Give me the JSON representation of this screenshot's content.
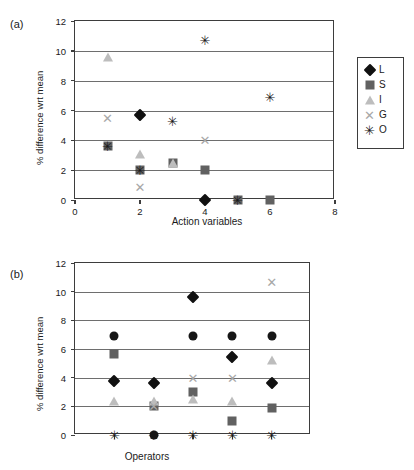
{
  "figure": {
    "background": "#ffffff",
    "panels": [
      {
        "label": "(a)",
        "xlabel": "Action variables",
        "ylabel": "% difference wrt mean"
      },
      {
        "label": "(b)",
        "xlabel": "Operators",
        "ylabel": "% difference wrt mean"
      }
    ]
  },
  "chart_data": [
    {
      "type": "scatter",
      "title": "(a)",
      "xlabel": "Action variables",
      "ylabel": "% difference wrt mean",
      "xlim": [
        0,
        8
      ],
      "ylim": [
        0,
        12
      ],
      "xticks": [
        0,
        2,
        4,
        6,
        8
      ],
      "xtick_labels": [
        "0",
        "2",
        "4",
        "6",
        "8"
      ],
      "yticks": [
        0,
        2,
        4,
        6,
        8,
        10,
        12
      ],
      "ytick_labels": [
        "0",
        "2",
        "4",
        "6",
        "8",
        "10",
        "12"
      ],
      "grid": "horizontal",
      "legend_position": "right",
      "series": [
        {
          "name": "L",
          "marker": "diamond",
          "color": "#111111",
          "points": [
            {
              "x": 2,
              "y": 5.7
            },
            {
              "x": 4,
              "y": 0.0
            }
          ]
        },
        {
          "name": "S",
          "marker": "square",
          "color": "#616161",
          "points": [
            {
              "x": 1,
              "y": 3.65
            },
            {
              "x": 2,
              "y": 2.0
            },
            {
              "x": 3,
              "y": 2.5
            },
            {
              "x": 4,
              "y": 2.0
            },
            {
              "x": 5,
              "y": 0.0
            },
            {
              "x": 6,
              "y": 0.0
            }
          ]
        },
        {
          "name": "I",
          "marker": "triangle",
          "color": "#bdbdbd",
          "points": [
            {
              "x": 1,
              "y": 9.6
            },
            {
              "x": 2,
              "y": 3.1
            },
            {
              "x": 3,
              "y": 2.5
            }
          ]
        },
        {
          "name": "G",
          "marker": "x",
          "color": "#a8a8a8",
          "points": [
            {
              "x": 1,
              "y": 5.5
            },
            {
              "x": 2,
              "y": 0.9
            },
            {
              "x": 4,
              "y": 4.0
            }
          ]
        },
        {
          "name": "O",
          "marker": "asterisk",
          "color": "#1a1a1a",
          "points": [
            {
              "x": 1,
              "y": 3.65
            },
            {
              "x": 2,
              "y": 2.0
            },
            {
              "x": 3,
              "y": 5.3
            },
            {
              "x": 4,
              "y": 10.7
            },
            {
              "x": 5,
              "y": 0.0
            },
            {
              "x": 6,
              "y": 6.9
            }
          ]
        }
      ]
    },
    {
      "type": "scatter",
      "title": "(b)",
      "xlabel": "Operators",
      "ylabel": "% difference wrt mean",
      "xlim": [
        0,
        6
      ],
      "ylim": [
        0,
        12
      ],
      "xticks": [
        1,
        2,
        3,
        4,
        5
      ],
      "xtick_labels": [
        "",
        "",
        "",
        "",
        ""
      ],
      "yticks": [
        0,
        2,
        4,
        6,
        8,
        10,
        12
      ],
      "ytick_labels": [
        "0",
        "2",
        "4",
        "6",
        "8",
        "10",
        "12"
      ],
      "grid": "horizontal",
      "legend_position": "right",
      "series": [
        {
          "name": "Tackle",
          "marker": "diamond",
          "color": "#111111",
          "points": [
            {
              "x": 1,
              "y": 3.8
            },
            {
              "x": 2,
              "y": 3.65
            },
            {
              "x": 3,
              "y": 9.65
            },
            {
              "x": 4,
              "y": 5.45
            },
            {
              "x": 5,
              "y": 3.65
            }
          ]
        },
        {
          "name": "Pass",
          "marker": "square",
          "color": "#616161",
          "points": [
            {
              "x": 1,
              "y": 5.65
            },
            {
              "x": 2,
              "y": 2.0
            },
            {
              "x": 3,
              "y": 3.0
            },
            {
              "x": 4,
              "y": 1.0
            },
            {
              "x": 5,
              "y": 1.9
            }
          ]
        },
        {
          "name": "Kick",
          "marker": "triangle",
          "color": "#bdbdbd",
          "points": [
            {
              "x": 1,
              "y": 2.4
            },
            {
              "x": 2,
              "y": 2.4
            },
            {
              "x": 3,
              "y": 2.5
            },
            {
              "x": 4,
              "y": 2.4
            },
            {
              "x": 5,
              "y": 5.2
            }
          ]
        },
        {
          "name": "Ruck",
          "marker": "x",
          "color": "#a8a8a8",
          "points": [
            {
              "x": 2,
              "y": 2.0
            },
            {
              "x": 3,
              "y": 4.0
            },
            {
              "x": 4,
              "y": 4.0
            },
            {
              "x": 5,
              "y": 10.7
            }
          ]
        },
        {
          "name": "Scrum",
          "marker": "asterisk",
          "color": "#1a1a1a",
          "points": [
            {
              "x": 1,
              "y": 0.0
            },
            {
              "x": 2,
              "y": 0.0
            },
            {
              "x": 3,
              "y": 0.0
            },
            {
              "x": 4,
              "y": 0.0
            },
            {
              "x": 5,
              "y": 0.0
            }
          ]
        },
        {
          "name": "Line",
          "marker": "circle",
          "color": "#161616",
          "points": [
            {
              "x": 1,
              "y": 6.9
            },
            {
              "x": 2,
              "y": 0.0
            },
            {
              "x": 3,
              "y": 6.9
            },
            {
              "x": 4,
              "y": 6.9
            },
            {
              "x": 5,
              "y": 6.9
            }
          ]
        }
      ]
    }
  ]
}
